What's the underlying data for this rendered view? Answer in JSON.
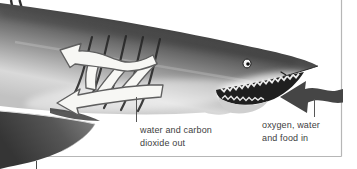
{
  "window": {
    "width_px": 357,
    "height_px": 169,
    "background": "#ffffff"
  },
  "diagram": {
    "frame_color": "#b6b6b6",
    "leader_color": "#565656",
    "text_color": "#3e3e3e",
    "shark": {
      "body_dark": "#2b2b2b",
      "body_light": "#dcdcdc",
      "fin_color": "#4a4a4a"
    },
    "arrows": {
      "water_out": {
        "fill": "#f7f7f4",
        "stroke": "#5f5f5f"
      },
      "water_in": {
        "fill": "#454545"
      }
    },
    "labels": {
      "water_out": {
        "line1": "water and carbon",
        "line2": "dioxide out"
      },
      "food_in": {
        "line1": "oxygen, water",
        "line2": "and food in"
      }
    }
  }
}
